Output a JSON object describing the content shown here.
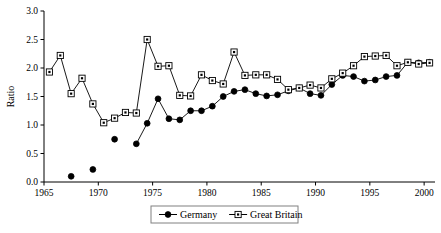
{
  "chart_data": {
    "type": "line",
    "title": "",
    "subtitle": "",
    "xlabel": "",
    "ylabel": "Ratio",
    "xlim": [
      1965,
      2001
    ],
    "ylim": [
      0.0,
      3.0
    ],
    "grid": false,
    "legend_position": "bottom-center",
    "x_ticks": [
      1965,
      1970,
      1975,
      1980,
      1985,
      1990,
      1995,
      2000
    ],
    "x_tick_labels": [
      "1965",
      "1970",
      "1975",
      "1980",
      "1985",
      "1990",
      "1995",
      "2000"
    ],
    "y_ticks": [
      0.0,
      0.5,
      1.0,
      1.5,
      2.0,
      2.5,
      3.0
    ],
    "y_tick_labels": [
      "0.0",
      "0.5",
      "1.0",
      "1.5",
      "2.0",
      "2.5",
      "3.0"
    ],
    "series": [
      {
        "name": "Germany",
        "marker": "filled-circle",
        "color": "#000000",
        "points": [
          {
            "x": 1967.5,
            "y": 0.1,
            "connected": false
          },
          {
            "x": 1969.5,
            "y": 0.22,
            "connected": false
          },
          {
            "x": 1971.5,
            "y": 0.75,
            "connected": false
          },
          {
            "x": 1973.5,
            "y": 0.67,
            "connected": true
          },
          {
            "x": 1974.5,
            "y": 1.03,
            "connected": true
          },
          {
            "x": 1975.5,
            "y": 1.46,
            "connected": true
          },
          {
            "x": 1976.5,
            "y": 1.11,
            "connected": true
          },
          {
            "x": 1977.5,
            "y": 1.09,
            "connected": true
          },
          {
            "x": 1978.5,
            "y": 1.25,
            "connected": true
          },
          {
            "x": 1979.5,
            "y": 1.25,
            "connected": true
          },
          {
            "x": 1980.5,
            "y": 1.33,
            "connected": true
          },
          {
            "x": 1981.5,
            "y": 1.5,
            "connected": true
          },
          {
            "x": 1982.5,
            "y": 1.59,
            "connected": true
          },
          {
            "x": 1983.5,
            "y": 1.62,
            "connected": true
          },
          {
            "x": 1984.5,
            "y": 1.55,
            "connected": true
          },
          {
            "x": 1985.5,
            "y": 1.51,
            "connected": true
          },
          {
            "x": 1986.5,
            "y": 1.53,
            "connected": true
          },
          {
            "x": 1987.5,
            "y": 1.6,
            "connected": true
          },
          {
            "x": 1988.5,
            "y": 1.65,
            "connected": true
          },
          {
            "x": 1989.5,
            "y": 1.55,
            "connected": true
          },
          {
            "x": 1990.5,
            "y": 1.52,
            "connected": true
          },
          {
            "x": 1991.5,
            "y": 1.71,
            "connected": true
          },
          {
            "x": 1992.5,
            "y": 1.87,
            "connected": true
          },
          {
            "x": 1993.5,
            "y": 1.85,
            "connected": true
          },
          {
            "x": 1994.5,
            "y": 1.77,
            "connected": true
          },
          {
            "x": 1995.5,
            "y": 1.79,
            "connected": true
          },
          {
            "x": 1996.5,
            "y": 1.85,
            "connected": true
          },
          {
            "x": 1997.5,
            "y": 1.87,
            "connected": true
          },
          {
            "x": 1998.5,
            "y": 2.1,
            "connected": true
          },
          {
            "x": 1999.5,
            "y": 2.09,
            "connected": true
          },
          {
            "x": 2000.5,
            "y": 2.1,
            "connected": true
          }
        ]
      },
      {
        "name": "Great Britain",
        "marker": "open-square",
        "color": "#000000",
        "points": [
          {
            "x": 1965.5,
            "y": 1.93,
            "connected": true
          },
          {
            "x": 1966.5,
            "y": 2.22,
            "connected": true
          },
          {
            "x": 1967.5,
            "y": 1.55,
            "connected": true
          },
          {
            "x": 1968.5,
            "y": 1.82,
            "connected": true
          },
          {
            "x": 1969.5,
            "y": 1.37,
            "connected": true
          },
          {
            "x": 1970.5,
            "y": 1.04,
            "connected": true
          },
          {
            "x": 1971.5,
            "y": 1.12,
            "connected": true
          },
          {
            "x": 1972.5,
            "y": 1.22,
            "connected": true
          },
          {
            "x": 1973.5,
            "y": 1.21,
            "connected": true
          },
          {
            "x": 1974.5,
            "y": 2.5,
            "connected": true
          },
          {
            "x": 1975.5,
            "y": 2.03,
            "connected": true
          },
          {
            "x": 1976.5,
            "y": 2.04,
            "connected": true
          },
          {
            "x": 1977.5,
            "y": 1.52,
            "connected": true
          },
          {
            "x": 1978.5,
            "y": 1.51,
            "connected": true
          },
          {
            "x": 1979.5,
            "y": 1.88,
            "connected": true
          },
          {
            "x": 1980.5,
            "y": 1.78,
            "connected": true
          },
          {
            "x": 1981.5,
            "y": 1.72,
            "connected": true
          },
          {
            "x": 1982.5,
            "y": 2.28,
            "connected": true
          },
          {
            "x": 1983.5,
            "y": 1.87,
            "connected": true
          },
          {
            "x": 1984.5,
            "y": 1.88,
            "connected": true
          },
          {
            "x": 1985.5,
            "y": 1.88,
            "connected": true
          },
          {
            "x": 1986.5,
            "y": 1.8,
            "connected": true
          },
          {
            "x": 1987.5,
            "y": 1.62,
            "connected": true
          },
          {
            "x": 1988.5,
            "y": 1.65,
            "connected": true
          },
          {
            "x": 1989.5,
            "y": 1.7,
            "connected": true
          },
          {
            "x": 1990.5,
            "y": 1.65,
            "connected": true
          },
          {
            "x": 1991.5,
            "y": 1.81,
            "connected": true
          },
          {
            "x": 1992.5,
            "y": 1.91,
            "connected": true
          },
          {
            "x": 1993.5,
            "y": 2.04,
            "connected": true
          },
          {
            "x": 1994.5,
            "y": 2.2,
            "connected": true
          },
          {
            "x": 1995.5,
            "y": 2.21,
            "connected": true
          },
          {
            "x": 1996.5,
            "y": 2.22,
            "connected": true
          },
          {
            "x": 1997.5,
            "y": 2.04,
            "connected": true
          },
          {
            "x": 1998.5,
            "y": 2.1,
            "connected": true
          },
          {
            "x": 1999.5,
            "y": 2.07,
            "connected": true
          },
          {
            "x": 2000.5,
            "y": 2.09,
            "connected": true
          }
        ]
      }
    ],
    "legend": [
      {
        "label": "Germany",
        "marker": "filled-circle"
      },
      {
        "label": "Great Britain",
        "marker": "open-square"
      }
    ]
  }
}
